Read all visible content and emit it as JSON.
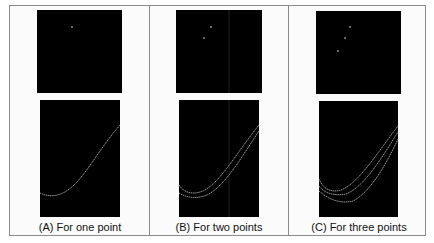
{
  "figure": {
    "panels": [
      {
        "id": "A",
        "caption": "(A) For one point",
        "point_count": 1,
        "top_view": {
          "points": [
            [
              35,
              17
            ]
          ]
        },
        "bottom_view": {
          "curves": [
            "M0,93 C8,97 18,97 28,90 C45,78 58,50 80,25"
          ]
        }
      },
      {
        "id": "B",
        "caption": "(B) For two points",
        "point_count": 2,
        "top_view": {
          "points": [
            [
              35,
              17
            ],
            [
              28,
              28
            ]
          ],
          "vertical_line_x": 53
        },
        "bottom_view": {
          "curves": [
            "M0,85 C5,93 14,95 24,91 C42,82 58,52 80,25",
            "M0,93 C8,98 18,99 28,95 C46,86 62,58 80,31"
          ],
          "vertical_line_x": 50
        }
      },
      {
        "id": "C",
        "caption": "(C) For three points",
        "point_count": 3,
        "top_view": {
          "points": [
            [
              34,
              16
            ],
            [
              29,
              27
            ],
            [
              22,
              40
            ]
          ]
        },
        "bottom_view": {
          "curves": [
            "M0,78 C4,88 12,92 22,89 C40,82 58,52 79,25",
            "M0,85 C6,93 16,95 27,93 C45,86 62,58 79,31",
            "M0,90 C10,99 22,103 34,100 C50,92 66,66 79,38"
          ]
        }
      }
    ],
    "colors": {
      "background": "#ffffff",
      "frame": "#8a8a8a",
      "plot_bg": "#000000",
      "curve": "#bdbdbd",
      "point": "#9a9a9a",
      "caption": "#111111"
    }
  }
}
